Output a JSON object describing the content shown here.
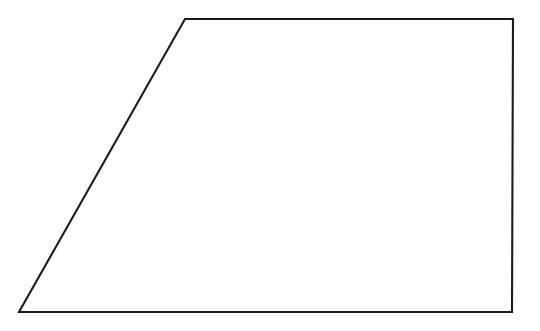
{
  "figure": {
    "kind": "geometric-line-drawing",
    "shape_name": "trapezoid",
    "canvas": {
      "width": 540,
      "height": 331,
      "background_color": "#ffffff"
    },
    "stroke": {
      "color": "#1c1c1c",
      "width_px": 2,
      "style": "solid",
      "linejoin": "miter"
    },
    "fill_color": "#ffffff",
    "vertices": [
      {
        "id": "top-left",
        "x": 185,
        "y": 19
      },
      {
        "id": "top-right",
        "x": 513,
        "y": 19
      },
      {
        "id": "bottom-right",
        "x": 512,
        "y": 312
      },
      {
        "id": "bottom-left",
        "x": 19,
        "y": 312
      }
    ],
    "points_attribute": "185,19 513,19 512,312 19,312",
    "edges": [
      {
        "id": "top-edge",
        "from": "top-left",
        "to": "top-right",
        "orientation": "horizontal"
      },
      {
        "id": "right-edge",
        "from": "top-right",
        "to": "bottom-right",
        "orientation": "vertical"
      },
      {
        "id": "bottom-edge",
        "from": "bottom-right",
        "to": "bottom-left",
        "orientation": "horizontal"
      },
      {
        "id": "left-edge",
        "from": "bottom-left",
        "to": "top-left",
        "orientation": "slanted"
      }
    ],
    "labels": []
  }
}
